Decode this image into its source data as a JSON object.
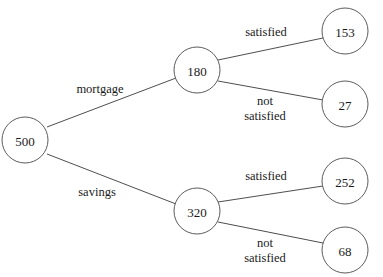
{
  "diagram": {
    "type": "probability-tree",
    "title": "",
    "background_color": "#ffffff",
    "node_stroke_color": "#4a4a4a",
    "edge_stroke_color": "#3a3a3a",
    "text_color": "#1a1a1a",
    "nodes": [
      {
        "id": "root",
        "label": "500",
        "cx": 25,
        "cy": 140,
        "r": 23,
        "level": 0
      },
      {
        "id": "mortgage",
        "label": "180",
        "cx": 197,
        "cy": 70,
        "r": 23,
        "level": 1
      },
      {
        "id": "savings",
        "label": "320",
        "cx": 197,
        "cy": 211,
        "r": 23,
        "level": 1
      },
      {
        "id": "m-satisfied",
        "label": "153",
        "cx": 345,
        "cy": 31,
        "r": 23,
        "level": 2
      },
      {
        "id": "m-not",
        "label": "27",
        "cx": 345,
        "cy": 104,
        "r": 23,
        "level": 2
      },
      {
        "id": "s-satisfied",
        "label": "252",
        "cx": 345,
        "cy": 181,
        "r": 23,
        "level": 2
      },
      {
        "id": "s-not",
        "label": "68",
        "cx": 345,
        "cy": 250,
        "r": 23,
        "level": 2
      }
    ],
    "edges": [
      {
        "id": "e-root-mortgage",
        "from": "root",
        "to": "mortgage",
        "label": "mortgage",
        "label_lines": [
          "mortgage"
        ],
        "label_x": 100,
        "label_y": 89,
        "x1": 47,
        "y1": 127,
        "x2": 176,
        "y2": 78
      },
      {
        "id": "e-root-savings",
        "from": "root",
        "to": "savings",
        "label": "savings",
        "label_lines": [
          "savings"
        ],
        "label_x": 97,
        "label_y": 192,
        "x1": 47,
        "y1": 154,
        "x2": 176,
        "y2": 204
      },
      {
        "id": "e-mortgage-sat",
        "from": "mortgage",
        "to": "m-satisfied",
        "label": "satisfied",
        "label_lines": [
          "satisfied"
        ],
        "label_x": 266,
        "label_y": 32,
        "x1": 218,
        "y1": 60,
        "x2": 323,
        "y2": 38
      },
      {
        "id": "e-mortgage-not",
        "from": "mortgage",
        "to": "m-not",
        "label": "not satisfied",
        "label_lines": [
          "not",
          "satisfied"
        ],
        "label_x": 265,
        "label_y": 108,
        "x1": 218,
        "y1": 81,
        "x2": 323,
        "y2": 100
      },
      {
        "id": "e-savings-sat",
        "from": "savings",
        "to": "s-satisfied",
        "label": "satisfied",
        "label_lines": [
          "satisfied"
        ],
        "label_x": 266,
        "label_y": 176,
        "x1": 218,
        "y1": 202,
        "x2": 323,
        "y2": 186
      },
      {
        "id": "e-savings-not",
        "from": "savings",
        "to": "s-not",
        "label": "not satisfied",
        "label_lines": [
          "not",
          "satisfied"
        ],
        "label_x": 265,
        "label_y": 250,
        "x1": 218,
        "y1": 222,
        "x2": 323,
        "y2": 243
      }
    ],
    "labels": {
      "root_value": "500",
      "branch_mortgage_value": "180",
      "branch_savings_value": "320",
      "leaf_mortgage_satisfied": "153",
      "leaf_mortgage_not_satisfied": "27",
      "leaf_savings_satisfied": "252",
      "leaf_savings_not_satisfied": "68",
      "branch_mortgage_label": "mortgage",
      "branch_savings_label": "savings",
      "satisfied_label_upper": "satisfied",
      "not_label_upper": "not",
      "satisfied2_label_upper": "satisfied",
      "satisfied_label_lower": "satisfied",
      "not_label_lower": "not",
      "satisfied2_label_lower": "satisfied"
    }
  }
}
